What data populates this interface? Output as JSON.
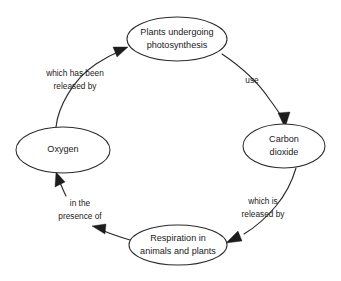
{
  "diagram": {
    "type": "cycle-diagram",
    "direction": "clockwise",
    "background_color": "#ffffff",
    "stroke_color": "#2b2b2b",
    "text_color": "#1a1a1a",
    "nodes": [
      {
        "id": "plants",
        "shape": "ellipse",
        "position": "top",
        "lines": [
          "Plants undergoing",
          "photosynthesis"
        ],
        "label": "Plants undergoing photosynthesis",
        "cx": 177,
        "cy": 39,
        "rx": 50,
        "ry": 22
      },
      {
        "id": "carbon-dioxide",
        "shape": "ellipse",
        "position": "right",
        "lines": [
          "Carbon",
          "dioxide"
        ],
        "label": "Carbon dioxide",
        "cx": 284,
        "cy": 146,
        "rx": 41,
        "ry": 22
      },
      {
        "id": "respiration",
        "shape": "ellipse",
        "position": "bottom",
        "lines": [
          "Respiration in",
          "animals and plants"
        ],
        "label": "Respiration in animals and plants",
        "cx": 178,
        "cy": 245,
        "rx": 49,
        "ry": 20
      },
      {
        "id": "oxygen",
        "shape": "ellipse",
        "position": "left",
        "lines": [
          "Oxygen"
        ],
        "label": "Oxygen",
        "cx": 63,
        "cy": 150,
        "rx": 47,
        "ry": 23
      }
    ],
    "edges": [
      {
        "id": "plants-to-carbon-dioxide",
        "from": "plants",
        "to": "carbon-dioxide",
        "label": "use",
        "label_lines": [
          "use"
        ],
        "label_x": 252,
        "label_y": 81
      },
      {
        "id": "carbon-dioxide-to-respiration",
        "from": "carbon-dioxide",
        "to": "respiration",
        "label": "which is released by",
        "label_lines": [
          "which is",
          "released by"
        ],
        "label_x": 263,
        "label_y": 208
      },
      {
        "id": "respiration-to-oxygen",
        "from": "respiration",
        "to": "oxygen",
        "label": "in the presence of",
        "label_lines": [
          "in the",
          "presence of"
        ],
        "label_x": 80,
        "label_y": 210
      },
      {
        "id": "oxygen-to-plants",
        "from": "oxygen",
        "to": "plants",
        "label": "which has been released by",
        "label_lines": [
          "which has been",
          "released by"
        ],
        "label_x": 75,
        "label_y": 80
      }
    ]
  }
}
